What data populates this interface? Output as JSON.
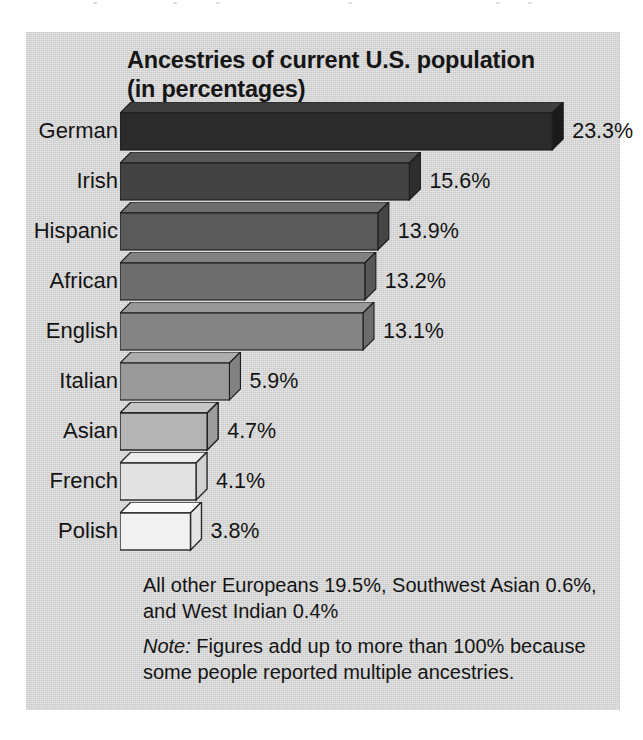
{
  "figure": {
    "panel_color": "#d4d4d4",
    "title_line_1": "Ancestries of current U.S. population",
    "title_line_2": "(in percentages)",
    "footnote_other": "All other Europeans 19.5%, Southwest Asian 0.6%, and West Indian 0.4%",
    "footnote_note_label": "Note:",
    "footnote_note_text": " Figures add up to more than 100% because some people reported multiple ancestries."
  },
  "chart_data": {
    "type": "bar",
    "orientation": "horizontal",
    "title": "Ancestries of current U.S. population (in percentages)",
    "xlabel": "",
    "ylabel": "",
    "xlim": [
      0,
      23.3
    ],
    "grid": false,
    "legend": "none",
    "units": "percent",
    "categories": [
      "German",
      "Irish",
      "Hispanic",
      "African",
      "English",
      "Italian",
      "Asian",
      "French",
      "Polish"
    ],
    "values": [
      23.3,
      15.6,
      13.9,
      13.2,
      13.1,
      5.9,
      4.7,
      4.1,
      3.8
    ],
    "value_labels": [
      "23.3%",
      "15.6%",
      "13.9%",
      "13.2%",
      "13.1%",
      "5.9%",
      "4.7%",
      "4.1%",
      "3.8%"
    ],
    "bar_colors": [
      "#2b2b2b",
      "#434343",
      "#5a5a5a",
      "#6e6e6e",
      "#848484",
      "#9a9a9a",
      "#b4b4b4",
      "#e2e2e2",
      "#f2f2f2"
    ],
    "bar_top_colors": [
      "#3e3e3e",
      "#565656",
      "#6d6d6d",
      "#828282",
      "#989898",
      "#adadad",
      "#c6c6c6",
      "#ededed",
      "#fafafa"
    ],
    "bar_side_colors": [
      "#1a1a1a",
      "#2e2e2e",
      "#454545",
      "#585858",
      "#6c6c6c",
      "#828282",
      "#9c9c9c",
      "#d2d2d2",
      "#e4e4e4"
    ],
    "annotations": [
      "All other Europeans 19.5%, Southwest Asian 0.6%, and West Indian 0.4%",
      "Note: Figures add up to more than 100% because some people reported multiple ancestries."
    ],
    "other_breakdown": {
      "All other Europeans": 19.5,
      "Southwest Asian": 0.6,
      "West Indian": 0.4
    }
  }
}
